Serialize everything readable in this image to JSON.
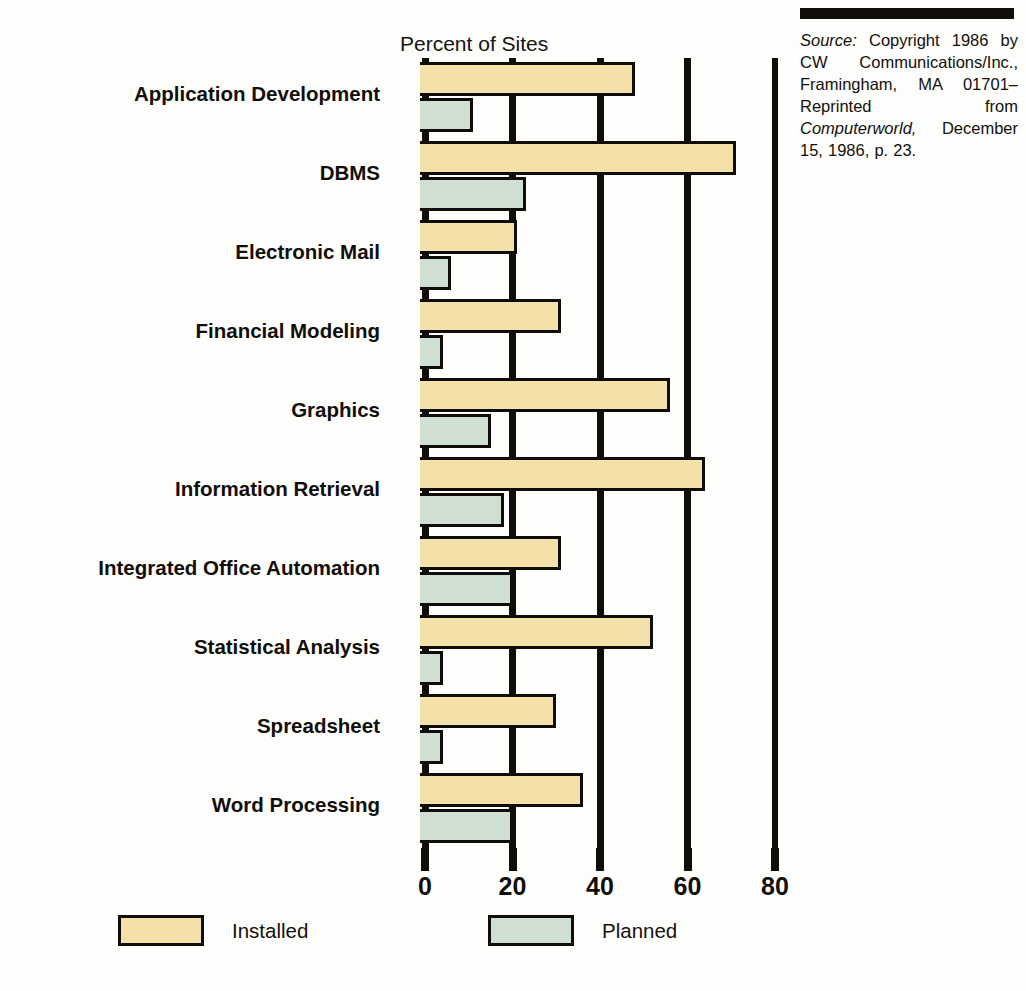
{
  "axis_title": "Percent of Sites",
  "source": {
    "label": "Source:",
    "text": " Copyright 1986 by CW Communications/Inc., Framingham, MA 01701–Reprinted from ",
    "publication": "Computerworld,",
    "tail": " December 15, 1986, p. 23."
  },
  "legend": {
    "items": [
      {
        "label": "Installed",
        "color": "#f4e0a9"
      },
      {
        "label": "Planned",
        "color": "#cfe0d2"
      }
    ]
  },
  "chart_data": {
    "type": "bar",
    "orientation": "horizontal",
    "title": "",
    "xlabel": "Percent of Sites",
    "ylabel": "",
    "xlim": [
      0,
      80
    ],
    "xticks": [
      0,
      20,
      40,
      60,
      80
    ],
    "tick_labels": [
      "0",
      "20",
      "40",
      "60",
      "80"
    ],
    "grid": true,
    "legend_position": "bottom",
    "categories": [
      "Application Development",
      "DBMS",
      "Electronic Mail",
      "Financial Modeling",
      "Graphics",
      "Information Retrieval",
      "Integrated Office Automation",
      "Statistical Analysis",
      "Spreadsheet",
      "Word Processing"
    ],
    "series": [
      {
        "name": "Installed",
        "color": "#f4e0a9",
        "values": [
          48,
          71,
          21,
          31,
          56,
          64,
          31,
          52,
          30,
          36
        ]
      },
      {
        "name": "Planned",
        "color": "#cfe0d2",
        "values": [
          11,
          23,
          6,
          4,
          15,
          18,
          20,
          4,
          4,
          20
        ]
      }
    ]
  }
}
